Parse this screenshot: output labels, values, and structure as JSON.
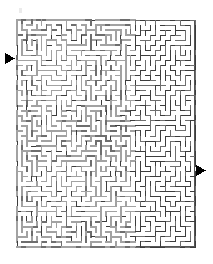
{
  "page": {
    "kind": "maze-puzzle",
    "background_color": "#ffffff",
    "width": 213,
    "height": 264
  },
  "maze": {
    "frame": {
      "x": 17,
      "y": 20,
      "width": 178,
      "height": 227,
      "border_color": "#555555",
      "border_width": 1,
      "fill_color": "#ffffff"
    },
    "grid": {
      "columns": 36,
      "rows": 45,
      "cell_size": 5
    },
    "wall_style": {
      "primary_color": "#a2a2a2",
      "secondary_color": "#6e6e6e",
      "dark_color": "#3c3c3c",
      "thickness": 1.5,
      "secondary_thickness": 1
    },
    "entrance": {
      "label": "entrance",
      "side": "left",
      "marker": "right-triangle",
      "marker_color": "#000000",
      "arrow_x": 5,
      "arrow_y": 53,
      "arrow_width": 10,
      "arrow_height": 11,
      "gap_row": 6
    },
    "exit": {
      "label": "exit",
      "side": "right",
      "marker": "right-triangle",
      "marker_color": "#000000",
      "arrow_x": 196,
      "arrow_y": 165,
      "arrow_width": 10,
      "arrow_height": 11,
      "gap_row": 29
    },
    "density_zones": [
      {
        "name": "left-dense-gray",
        "x_from": 0,
        "x_to": 24,
        "shade": "primary"
      },
      {
        "name": "right-thin-dark",
        "x_from": 24,
        "x_to": 36,
        "shade": "dark"
      }
    ],
    "seed": 20240517
  },
  "marks": [
    {
      "name": "faint-mark",
      "x": 19,
      "y": 8,
      "width": 3,
      "height": 5,
      "color": "#e8e8e8"
    }
  ]
}
